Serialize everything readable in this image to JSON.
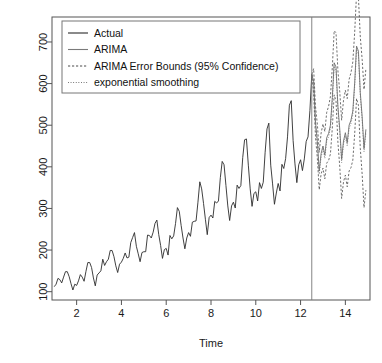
{
  "chart_data": {
    "type": "line",
    "title": "",
    "xlabel": "Time",
    "ylabel": "",
    "xlim": [
      0.9,
      15.1
    ],
    "ylim": [
      80,
      760
    ],
    "grid": false,
    "legend_position": "top-left",
    "forecast_start": 12.5,
    "xticks": [
      2,
      4,
      6,
      8,
      10,
      12,
      14
    ],
    "yticks": [
      100,
      200,
      300,
      400,
      500,
      600,
      700
    ],
    "xtick_labels": [
      "2",
      "4",
      "6",
      "8",
      "10",
      "12",
      "14"
    ],
    "ytick_labels": [
      "100",
      "200",
      "300",
      "400",
      "500",
      "600",
      "700"
    ],
    "legend": [
      {
        "label": "Actual",
        "style": "solid",
        "color": "#2b2b2b"
      },
      {
        "label": "ARIMA",
        "style": "solid",
        "color": "#7a7a7a"
      },
      {
        "label": "ARIMA Error Bounds (95% Confidence)",
        "style": "dashed",
        "color": "#4a4a4a"
      },
      {
        "label": "exponential smoothing",
        "style": "dotted",
        "color": "#6a6a6a"
      }
    ],
    "series": [
      {
        "name": "Actual",
        "style": "solid",
        "x": [
          1.0,
          1.083,
          1.167,
          1.25,
          1.333,
          1.417,
          1.5,
          1.583,
          1.667,
          1.75,
          1.833,
          1.917,
          2.0,
          2.083,
          2.167,
          2.25,
          2.333,
          2.417,
          2.5,
          2.583,
          2.667,
          2.75,
          2.833,
          2.917,
          3.0,
          3.083,
          3.167,
          3.25,
          3.333,
          3.417,
          3.5,
          3.583,
          3.667,
          3.75,
          3.833,
          3.917,
          4.0,
          4.083,
          4.167,
          4.25,
          4.333,
          4.417,
          4.5,
          4.583,
          4.667,
          4.75,
          4.833,
          4.917,
          5.0,
          5.083,
          5.167,
          5.25,
          5.333,
          5.417,
          5.5,
          5.583,
          5.667,
          5.75,
          5.833,
          5.917,
          6.0,
          6.083,
          6.167,
          6.25,
          6.333,
          6.417,
          6.5,
          6.583,
          6.667,
          6.75,
          6.833,
          6.917,
          7.0,
          7.083,
          7.167,
          7.25,
          7.333,
          7.417,
          7.5,
          7.583,
          7.667,
          7.75,
          7.833,
          7.917,
          8.0,
          8.083,
          8.167,
          8.25,
          8.333,
          8.417,
          8.5,
          8.583,
          8.667,
          8.75,
          8.833,
          8.917,
          9.0,
          9.083,
          9.167,
          9.25,
          9.333,
          9.417,
          9.5,
          9.583,
          9.667,
          9.75,
          9.833,
          9.917,
          10.0,
          10.083,
          10.167,
          10.25,
          10.333,
          10.417,
          10.5,
          10.583,
          10.667,
          10.75,
          10.833,
          10.917,
          11.0,
          11.083,
          11.167,
          11.25,
          11.333,
          11.417,
          11.5,
          11.583,
          11.667,
          11.75,
          11.833,
          11.917,
          12.0,
          12.083,
          12.167,
          12.25,
          12.333,
          12.417,
          12.5
        ],
        "y": [
          112,
          118,
          132,
          129,
          121,
          135,
          148,
          148,
          136,
          119,
          104,
          118,
          115,
          126,
          141,
          135,
          125,
          149,
          170,
          170,
          158,
          133,
          114,
          140,
          145,
          150,
          178,
          163,
          172,
          178,
          199,
          199,
          184,
          162,
          146,
          166,
          171,
          180,
          193,
          181,
          183,
          218,
          230,
          242,
          209,
          191,
          172,
          194,
          196,
          196,
          236,
          235,
          229,
          243,
          264,
          272,
          237,
          211,
          180,
          201,
          204,
          188,
          235,
          227,
          234,
          264,
          302,
          293,
          259,
          229,
          203,
          229,
          242,
          233,
          267,
          269,
          270,
          315,
          364,
          347,
          312,
          274,
          237,
          278,
          284,
          277,
          317,
          313,
          318,
          374,
          413,
          405,
          355,
          306,
          271,
          306,
          315,
          301,
          356,
          348,
          355,
          422,
          465,
          467,
          404,
          347,
          305,
          336,
          340,
          318,
          362,
          348,
          363,
          435,
          491,
          505,
          404,
          359,
          310,
          337,
          360,
          342,
          406,
          396,
          420,
          472,
          548,
          559,
          463,
          407,
          362,
          405,
          417,
          391,
          419,
          461,
          472,
          535,
          622
        ]
      },
      {
        "name": "ARIMA",
        "style": "solid",
        "x": [
          12.5,
          12.583,
          12.667,
          12.75,
          12.833,
          12.917,
          13.0,
          13.083,
          13.167,
          13.25,
          13.333,
          13.417,
          13.5,
          13.583,
          13.667,
          13.75,
          13.833,
          13.917,
          14.0,
          14.083,
          14.167,
          14.25,
          14.333,
          14.417,
          14.5,
          14.583,
          14.667,
          14.75,
          14.833,
          14.917
        ],
        "y": [
          622,
          606,
          508,
          461,
          390,
          432,
          450,
          428,
          470,
          480,
          500,
          566,
          650,
          640,
          545,
          490,
          418,
          462,
          482,
          458,
          500,
          512,
          534,
          602,
          690,
          678,
          578,
          520,
          444,
          490
        ]
      },
      {
        "name": "ARIMA Error Bounds (95% Confidence) - upper",
        "style": "dashed",
        "x": [
          12.5,
          12.583,
          12.667,
          12.75,
          12.833,
          12.917,
          13.0,
          13.083,
          13.167,
          13.25,
          13.333,
          13.417,
          13.5,
          13.583,
          13.667,
          13.75,
          13.833,
          13.917,
          14.0,
          14.083,
          14.167,
          14.25,
          14.333,
          14.417,
          14.5,
          14.583,
          14.667,
          14.75,
          14.833,
          14.917
        ],
        "y": [
          622,
          636,
          545,
          502,
          435,
          481,
          503,
          485,
          531,
          545,
          569,
          639,
          727,
          722,
          631,
          580,
          512,
          560,
          584,
          564,
          610,
          626,
          652,
          724,
          816,
          808,
          712,
          658,
          586,
          636
        ]
      },
      {
        "name": "ARIMA Error Bounds (95% Confidence) - lower",
        "style": "dashed",
        "x": [
          12.5,
          12.583,
          12.667,
          12.75,
          12.833,
          12.917,
          13.0,
          13.083,
          13.167,
          13.25,
          13.333,
          13.417,
          13.5,
          13.583,
          13.667,
          13.75,
          13.833,
          13.917,
          14.0,
          14.083,
          14.167,
          14.25,
          14.333,
          14.417,
          14.5,
          14.583,
          14.667,
          14.75,
          14.833,
          14.917
        ],
        "y": [
          622,
          576,
          471,
          420,
          345,
          383,
          397,
          371,
          409,
          415,
          431,
          493,
          573,
          558,
          459,
          400,
          324,
          364,
          380,
          352,
          390,
          398,
          416,
          480,
          564,
          548,
          444,
          382,
          302,
          344
        ]
      },
      {
        "name": "exponential smoothing",
        "style": "dotted",
        "x": [
          12.5,
          12.583,
          12.667,
          12.75,
          12.833,
          12.917,
          13.0,
          13.083,
          13.167,
          13.25,
          13.333,
          13.417,
          13.5,
          13.583,
          13.667,
          13.75,
          13.833,
          13.917,
          14.0,
          14.083,
          14.167,
          14.25,
          14.333,
          14.417,
          14.5,
          14.583,
          14.667,
          14.75,
          14.833,
          14.917
        ],
        "y": [
          622,
          598,
          498,
          452,
          382,
          424,
          442,
          420,
          462,
          472,
          492,
          558,
          642,
          632,
          538,
          482,
          410,
          454,
          474,
          450,
          492,
          504,
          526,
          594,
          682,
          670,
          570,
          512,
          436,
          482
        ]
      }
    ]
  }
}
